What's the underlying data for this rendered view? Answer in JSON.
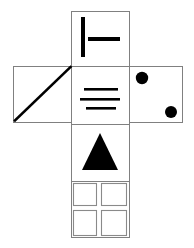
{
  "figure": {
    "background_color": "#ffffff",
    "outline_color": "#808080",
    "glyph_color": "#000000",
    "sub_cell_color": "#8a8a8a"
  },
  "layout": {
    "cell_size": 58,
    "column_x": 71,
    "row_y": 66,
    "rows": [
      11,
      66,
      124,
      181
    ],
    "left_x": 13,
    "right_x": 129,
    "bottom_y": 238
  },
  "cells": [
    {
      "id": "cell-top",
      "name": "top-cell",
      "position": "top",
      "symbol": "tee-bars",
      "x": 71,
      "y": 11,
      "w": 58,
      "h": 55,
      "shapes": [
        {
          "kind": "vertical-bar",
          "x": 81,
          "y": 17,
          "w": 4,
          "h": 40
        },
        {
          "kind": "horizontal-bar",
          "x": 88,
          "y": 37,
          "w": 32,
          "h": 4
        }
      ]
    },
    {
      "id": "cell-left",
      "name": "left-cell",
      "position": "left",
      "symbol": "diagonal-line",
      "x": 13,
      "y": 66,
      "w": 58,
      "h": 56,
      "shapes": [
        {
          "kind": "diagonal",
          "x1": 15,
          "y1": 120,
          "x2": 70,
          "y2": 67,
          "width": 2.6
        }
      ]
    },
    {
      "id": "cell-center",
      "name": "center-cell",
      "position": "center",
      "symbol": "equals-lines",
      "x": 71,
      "y": 66,
      "w": 58,
      "h": 58,
      "shapes": [
        {
          "kind": "rule",
          "x": 84,
          "y": 88,
          "w": 34,
          "h": 2.6
        },
        {
          "kind": "rule",
          "x": 80,
          "y": 98,
          "w": 40,
          "h": 2.6
        },
        {
          "kind": "rule",
          "x": 86,
          "y": 107,
          "w": 30,
          "h": 2.6
        }
      ]
    },
    {
      "id": "cell-right",
      "name": "right-cell",
      "position": "right",
      "symbol": "two-dots",
      "x": 129,
      "y": 66,
      "w": 54,
      "h": 56,
      "shapes": [
        {
          "kind": "dot",
          "cx": 142,
          "cy": 78,
          "r": 6.2
        },
        {
          "kind": "dot",
          "cx": 171,
          "cy": 112,
          "r": 6.0
        }
      ]
    },
    {
      "id": "cell-lower",
      "name": "lower-cell",
      "position": "lower",
      "symbol": "filled-triangle",
      "x": 71,
      "y": 124,
      "w": 58,
      "h": 57,
      "shapes": [
        {
          "kind": "triangle",
          "apex_x": 100,
          "apex_y": 133,
          "base_left_x": 82,
          "base_right_x": 118,
          "base_y": 170
        }
      ]
    },
    {
      "id": "cell-bottom",
      "name": "bottom-cell",
      "position": "bottom",
      "symbol": "quadrant-grid",
      "x": 71,
      "y": 181,
      "w": 58,
      "h": 57,
      "sub_cells": [
        {
          "id": "quad-top-left",
          "x": 73,
          "y": 183,
          "w": 24,
          "h": 23
        },
        {
          "id": "quad-top-right",
          "x": 101,
          "y": 183,
          "w": 26,
          "h": 23
        },
        {
          "id": "quad-bottom-left",
          "x": 73,
          "y": 210,
          "w": 24,
          "h": 26
        },
        {
          "id": "quad-bottom-right",
          "x": 101,
          "y": 210,
          "w": 26,
          "h": 26
        }
      ]
    }
  ]
}
